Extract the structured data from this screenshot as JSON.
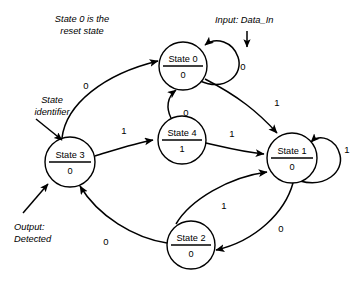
{
  "diagram": {
    "type": "state-transition-diagram",
    "title": "",
    "input_signal": "Data_In",
    "output_signal": "Detected",
    "reset_state": "State 0",
    "states": [
      {
        "id": "s0",
        "name": "State 0",
        "output": "0",
        "cx": 183,
        "cy": 66,
        "r": 24
      },
      {
        "id": "s4",
        "name": "State 4",
        "output": "1",
        "cx": 182,
        "cy": 140,
        "r": 24
      },
      {
        "id": "s3",
        "name": "State 3",
        "output": "0",
        "cx": 70,
        "cy": 162,
        "r": 25
      },
      {
        "id": "s1",
        "name": "State 1",
        "output": "0",
        "cx": 292,
        "cy": 158,
        "r": 25
      },
      {
        "id": "s2",
        "name": "State 2",
        "output": "0",
        "cx": 191,
        "cy": 245,
        "r": 24
      }
    ],
    "transitions": [
      {
        "from": "s0",
        "to": "s0",
        "label": "0",
        "label_x": 243,
        "label_y": 67
      },
      {
        "from": "s0",
        "to": "s1",
        "label": "1",
        "label_x": 277,
        "label_y": 103
      },
      {
        "from": "s3",
        "to": "s0",
        "label": "0",
        "label_x": 86,
        "label_y": 86
      },
      {
        "from": "s3",
        "to": "s4",
        "label": "1",
        "label_x": 124,
        "label_y": 131
      },
      {
        "from": "s4",
        "to": "s0",
        "label": "0",
        "label_x": 186,
        "label_y": 113
      },
      {
        "from": "s4",
        "to": "s1",
        "label": "1",
        "label_x": 232,
        "label_y": 134
      },
      {
        "from": "s1",
        "to": "s1",
        "label": "1",
        "label_x": 345,
        "label_y": 150
      },
      {
        "from": "s1",
        "to": "s2",
        "label": "0",
        "label_x": 281,
        "label_y": 229
      },
      {
        "from": "s2",
        "to": "s1",
        "label": "1",
        "label_x": 224,
        "label_y": 206
      },
      {
        "from": "s2",
        "to": "s3",
        "label": "0",
        "label_x": 106,
        "label_y": 242
      }
    ],
    "annotations": [
      {
        "id": "reset-note",
        "lines": [
          "State 0 is the",
          "reset state"
        ],
        "x": 31,
        "y": 19,
        "align": "middle",
        "anchor_x": 82
      },
      {
        "id": "input-note",
        "lines": [
          "Input: Data_In"
        ],
        "x": 215,
        "y": 20,
        "align": "start",
        "anchor_x": 215
      },
      {
        "id": "state-identifier-note",
        "lines": [
          "State",
          "identifier"
        ],
        "x": 22,
        "y": 100,
        "align": "middle",
        "anchor_x": 52
      },
      {
        "id": "output-note",
        "lines": [
          "Output:",
          "Detected"
        ],
        "x": 14,
        "y": 227,
        "align": "start",
        "anchor_x": 14
      }
    ],
    "colors": {
      "stroke": "#000000",
      "fill": "#ffffff",
      "background": "#ffffff"
    }
  }
}
